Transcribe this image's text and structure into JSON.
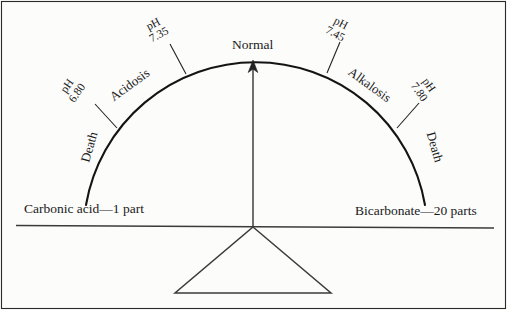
{
  "figure": {
    "background_color": "#fcfcfb",
    "line_color": "#1a1a1a",
    "arc": {
      "apex_label": "Normal",
      "left_end_label": "Death",
      "right_end_label": "Death"
    },
    "ph_markers": [
      {
        "unit": "pH",
        "value": "6.80",
        "side": "left",
        "rotation_deg": -55
      },
      {
        "unit": "pH",
        "value": "7.35",
        "side": "left",
        "rotation_deg": -28
      },
      {
        "unit": "pH",
        "value": "7.45",
        "side": "right",
        "rotation_deg": 28
      },
      {
        "unit": "pH",
        "value": "7.80",
        "side": "right",
        "rotation_deg": 55
      }
    ],
    "zones": {
      "left": "Acidosis",
      "right": "Alkalosis"
    },
    "death_labels": {
      "left": "Death",
      "right": "Death"
    },
    "beam": {
      "left_label": "Carbonic acid—1 part",
      "right_label": "Bicarbonate—20 parts"
    },
    "pointer": {
      "description": "arrow",
      "points_to": "Normal"
    }
  }
}
